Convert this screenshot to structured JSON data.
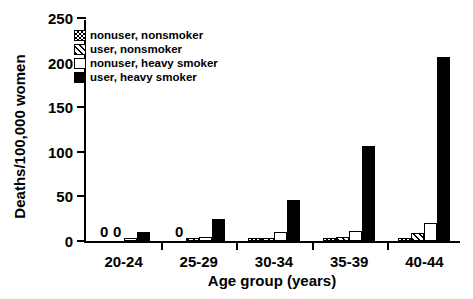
{
  "chart_data": {
    "type": "bar",
    "title": "",
    "xlabel": "Age group (years)",
    "ylabel": "Deaths/100,000 women",
    "categories": [
      "20-24",
      "25-29",
      "30-34",
      "35-39",
      "40-44"
    ],
    "ylim": [
      0,
      250
    ],
    "yticks": [
      0,
      50,
      100,
      150,
      200,
      250
    ],
    "ytick_labels": [
      "0",
      "50",
      "100",
      "150",
      "200",
      "250"
    ],
    "grid": false,
    "legend_position": "upper left",
    "series": [
      {
        "name": "nonuser, nonsmoker",
        "pattern": "checkered",
        "color": "#000000",
        "values": [
          0,
          0,
          1.5,
          2,
          3
        ],
        "labels": [
          "0",
          "0",
          "",
          "",
          ""
        ]
      },
      {
        "name": "user, nonsmoker",
        "pattern": "diagonal-hatch",
        "color": "#000000",
        "values": [
          0,
          2,
          3,
          5,
          9
        ],
        "labels": [
          "0",
          "",
          "",
          "",
          ""
        ]
      },
      {
        "name": "nonuser, heavy smoker",
        "pattern": "solid-white",
        "color": "#ffffff",
        "values": [
          2,
          4,
          10,
          11,
          20
        ],
        "labels": [
          "",
          "",
          "",
          "",
          ""
        ]
      },
      {
        "name": "user, heavy smoker",
        "pattern": "solid-black",
        "color": "#000000",
        "values": [
          10,
          25,
          46,
          107,
          206
        ],
        "labels": [
          "",
          "",
          "",
          "",
          ""
        ]
      }
    ]
  },
  "legend": {
    "items": [
      {
        "label": "nonuser, nonsmoker"
      },
      {
        "label": "user, nonsmoker"
      },
      {
        "label": "nonuser, heavy smoker"
      },
      {
        "label": "user, heavy smoker"
      }
    ]
  }
}
